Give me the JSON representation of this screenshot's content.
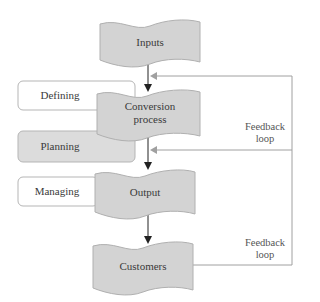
{
  "diagram": {
    "process_steps": [
      {
        "id": "inputs",
        "label": "Inputs"
      },
      {
        "id": "conversion",
        "label_line1": "Conversion",
        "label_line2": "process"
      },
      {
        "id": "output",
        "label": "Output"
      },
      {
        "id": "customers",
        "label": "Customers"
      }
    ],
    "management_functions": [
      {
        "id": "defining",
        "label": "Defining"
      },
      {
        "id": "planning",
        "label": "Planning"
      },
      {
        "id": "managing",
        "label": "Managing"
      }
    ],
    "feedback_loops": [
      {
        "id": "feedback-upper",
        "label_line1": "Feedback",
        "label_line2": "loop"
      },
      {
        "id": "feedback-lower",
        "label_line1": "Feedback",
        "label_line2": "loop"
      }
    ],
    "colors": {
      "banner_fill": "#d3d3d3",
      "banner_stroke": "#9a9a9a",
      "box_fill_light": "#ffffff",
      "box_fill_gray": "#dcdcdc",
      "box_stroke": "#b0b0b0",
      "arrow_dark": "#222222",
      "feedback_line": "#9a9a9a"
    }
  }
}
